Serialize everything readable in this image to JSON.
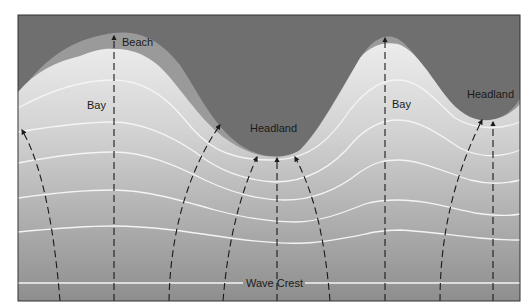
{
  "diagram": {
    "type": "wave refraction around headlands and bays",
    "labels": {
      "beach": "Beach",
      "bay_left": "Bay",
      "bay_right": "Bay",
      "headland_center": "Headland",
      "headland_right": "Headland",
      "wave_crest": "Wave Crest"
    },
    "colors": {
      "land": "#6f6f6f",
      "beach": "#9a9a9a",
      "water_top": "#e6e6e6",
      "water_bottom": "#8f8f8f",
      "wave_crest_line": "#f4f4f4",
      "orthogonal_arrow": "#1a1a1a",
      "border": "#333333"
    },
    "wave_crest_count": 7,
    "orthogonal_count": 10
  }
}
